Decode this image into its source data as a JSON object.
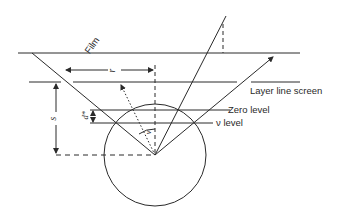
{
  "diagram": {
    "labels": {
      "film": "Film",
      "layer_line_screen": "Layer line screen",
      "zero_level": "Zero level",
      "nu_level": "ν level",
      "r": "r",
      "s": "s",
      "d_star": "d*",
      "nu": "ν"
    },
    "colors": {
      "stroke": "#2a2a2a",
      "background": "#ffffff"
    }
  }
}
